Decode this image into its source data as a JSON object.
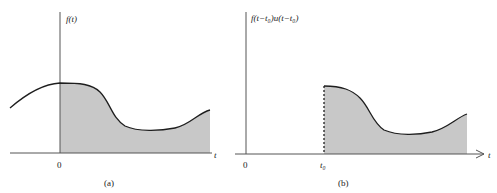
{
  "panels": [
    {
      "id": "a",
      "ylabel": "f(t)",
      "xlabel": "t",
      "origin_label": "0",
      "caption": "(a)"
    },
    {
      "id": "b",
      "ylabel": "f(t−t₀)u(t−t₀)",
      "xlabel": "t",
      "origin_label": "0",
      "shift_label": "t₀",
      "caption": "(b)"
    }
  ],
  "colors": {
    "curve": "#1e1e1e",
    "axis": "#555555",
    "fill": "#c8c8c8"
  }
}
